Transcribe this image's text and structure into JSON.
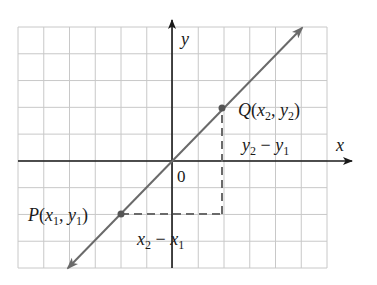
{
  "diagram": {
    "type": "coordinate-plane-line-slope",
    "grid": {
      "left": 18,
      "top": 27,
      "right": 327,
      "bottom": 268,
      "cols": 12,
      "rows": 9,
      "color": "#c8c8c8"
    },
    "axes": {
      "origin_px": [
        172,
        161
      ],
      "x_label": "x",
      "y_label": "y",
      "origin_label": "0",
      "color": "#1a1a1a"
    },
    "line": {
      "from_px": [
        68,
        268
      ],
      "to_px": [
        302,
        28
      ],
      "color": "#6a6a6a"
    },
    "points": [
      {
        "id": "P",
        "name": "P",
        "sub_x": "1",
        "sub_y": "1",
        "label": "P(x1, y1)",
        "px": [
          121,
          214
        ],
        "grid": [
          -2,
          -2
        ]
      },
      {
        "id": "Q",
        "name": "Q",
        "sub_x": "2",
        "sub_y": "2",
        "label": "Q(x2, y2)",
        "px": [
          222,
          108
        ],
        "grid": [
          2,
          2
        ]
      }
    ],
    "rise_label": "y2 − y1",
    "run_label": "x2 − x1",
    "dash_color": "#6a6a6a"
  },
  "text": {
    "y_axis": "y",
    "x_axis": "x",
    "origin": "0",
    "P_letter": "P",
    "P_open": "(",
    "P_x": "x",
    "P_x_sub": "1",
    "P_comma": ", ",
    "P_y": "y",
    "P_y_sub": "1",
    "P_close": ")",
    "Q_letter": "Q",
    "Q_open": "(",
    "Q_x": "x",
    "Q_x_sub": "2",
    "Q_comma": ", ",
    "Q_y": "y",
    "Q_y_sub": "2",
    "Q_close": ")",
    "rise_a": "y",
    "rise_a_sub": "2",
    "rise_op": " − ",
    "rise_b": "y",
    "rise_b_sub": "1",
    "run_a": "x",
    "run_a_sub": "2",
    "run_op": " − ",
    "run_b": "x",
    "run_b_sub": "1"
  }
}
